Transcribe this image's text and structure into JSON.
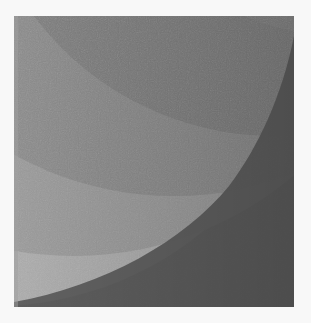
{
  "image": {
    "description": "Grayscale abstract composition of concentric quarter-circle arcs inside a square",
    "background_color": "#f8f8f8",
    "square": {
      "x": 14,
      "y": 16,
      "width": 280,
      "height": 291
    },
    "bands": [
      {
        "name": "outer-dark-corner",
        "color": "#5c5c5c"
      },
      {
        "name": "light-band",
        "color": "#acacac"
      },
      {
        "name": "medium-light-band",
        "color": "#9a9a9a"
      },
      {
        "name": "medium-band",
        "color": "#8a8a8a"
      },
      {
        "name": "dark-inner-band",
        "color": "#7e7e7e"
      },
      {
        "name": "right-edge-shadow",
        "color": "#6a6a6a"
      }
    ]
  }
}
